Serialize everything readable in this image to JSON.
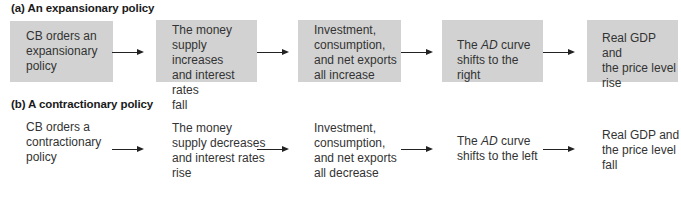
{
  "diagram": {
    "sections": [
      {
        "title": "(a) An expansionary policy",
        "steps": [
          "CB orders an expansionary policy",
          "The money supply increases and interest rates fall",
          "Investment, consumption, and net exports all increase",
          "The AD curve shifts to the right",
          "Real GDP and the price level rise"
        ]
      },
      {
        "title": "(b) A contractionary policy",
        "steps": [
          "CB orders a contractionary policy",
          "The money supply decreases and interest rates rise",
          "Investment, consumption, and net exports all decrease",
          "The AD curve shifts to the left",
          "Real GDP and the price level fall"
        ]
      }
    ],
    "lines": {
      "a": {
        "s0": [
          "CB orders an",
          "expansionary",
          "policy"
        ],
        "s1": [
          "The money",
          "supply increases",
          "and interest rates",
          "fall"
        ],
        "s2": [
          "Investment,",
          "consumption,",
          "and net exports",
          "all increase"
        ],
        "s3_pre": "The ",
        "s3_ital": "AD",
        "s3_post": " curve",
        "s3_l2": "shifts to the right",
        "s4": [
          "Real GDP and",
          "the price level",
          "rise"
        ]
      },
      "b": {
        "s0": [
          "CB orders a",
          "contractionary",
          "policy"
        ],
        "s1": [
          "The money",
          "supply decreases",
          "and interest rates",
          "rise"
        ],
        "s2": [
          "Investment,",
          "consumption,",
          "and net exports",
          "all decrease"
        ],
        "s3_pre": "The ",
        "s3_ital": "AD",
        "s3_post": " curve",
        "s3_l2": "shifts to the left",
        "s4": [
          "Real GDP and",
          "the price level",
          "fall"
        ]
      }
    },
    "colors": {
      "box_fill": "#d2d2d2",
      "text": "#333333",
      "arrow": "#222222"
    }
  }
}
